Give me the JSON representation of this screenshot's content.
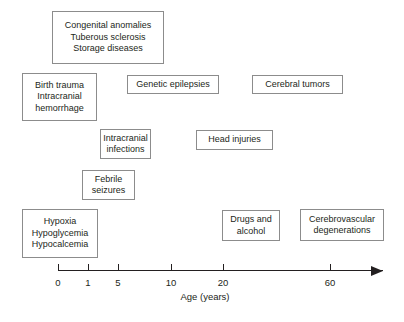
{
  "figure": {
    "type": "timeline-diagram",
    "title": "",
    "boxes": [
      {
        "id": "congenital",
        "lines": [
          "Congenital anomalies",
          "Tuberous sclerosis",
          "Storage diseases"
        ],
        "x": 52,
        "y": 11,
        "w": 112,
        "h": 53
      },
      {
        "id": "birth-trauma",
        "lines": [
          "Birth trauma",
          "Intracranial",
          "hemorrhage"
        ],
        "x": 22,
        "y": 73,
        "w": 75,
        "h": 48
      },
      {
        "id": "genetic-epilepsies",
        "lines": [
          "Genetic epilepsies"
        ],
        "x": 127,
        "y": 75,
        "w": 92,
        "h": 19
      },
      {
        "id": "cerebral-tumors",
        "lines": [
          "Cerebral tumors"
        ],
        "x": 252,
        "y": 75,
        "w": 91,
        "h": 19
      },
      {
        "id": "intracranial-infections",
        "lines": [
          "Intracranial",
          "infections"
        ],
        "x": 100,
        "y": 129,
        "w": 51,
        "h": 30
      },
      {
        "id": "head-injuries",
        "lines": [
          "Head injuries"
        ],
        "x": 196,
        "y": 130,
        "w": 77,
        "h": 20
      },
      {
        "id": "febrile-seizures",
        "lines": [
          "Febrile",
          "seizures"
        ],
        "x": 82,
        "y": 170,
        "w": 53,
        "h": 30
      },
      {
        "id": "hypoxia",
        "lines": [
          "Hypoxia",
          "Hypoglycemia",
          "Hypocalcemia"
        ],
        "x": 22,
        "y": 209,
        "w": 76,
        "h": 49
      },
      {
        "id": "drugs-alcohol",
        "lines": [
          "Drugs and",
          "alcohol"
        ],
        "x": 222,
        "y": 210,
        "w": 58,
        "h": 31
      },
      {
        "id": "cerebrovascular",
        "lines": [
          "Cerebrovascular",
          "degenerations"
        ],
        "x": 300,
        "y": 209,
        "w": 84,
        "h": 32
      }
    ],
    "axis": {
      "title": "Age (years)",
      "ticks": [
        {
          "label": "0",
          "x": 58
        },
        {
          "label": "1",
          "x": 88
        },
        {
          "label": "5",
          "x": 118
        },
        {
          "label": "10",
          "x": 171
        },
        {
          "label": "20",
          "x": 223
        },
        {
          "label": "60",
          "x": 330
        }
      ],
      "line_start_x": 58,
      "line_end_x": 383,
      "arrow": "right-arrow"
    },
    "colors": {
      "box_border": "#8c8c8c",
      "text": "#231f20",
      "axis": "#231f20",
      "background": "#ffffff"
    }
  }
}
